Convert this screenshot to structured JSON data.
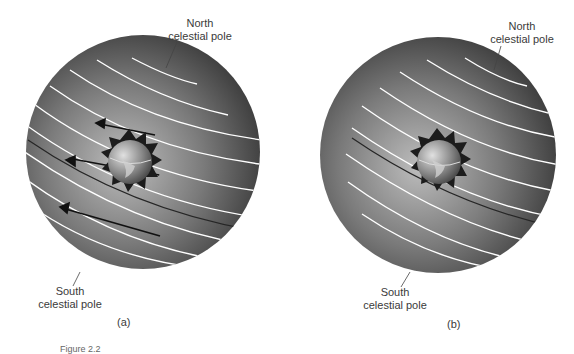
{
  "figure": {
    "caption_partial": "Figure 2.2",
    "panels": [
      {
        "id": "a",
        "panel_label": "(a)",
        "north_label_line1": "North",
        "north_label_line2": "celestial pole",
        "south_label_line1": "South",
        "south_label_line2": "celestial pole",
        "shows_motion_arrows": true
      },
      {
        "id": "b",
        "panel_label": "(b)",
        "north_label_line1": "North",
        "north_label_line2": "celestial pole",
        "south_label_line1": "South",
        "south_label_line2": "celestial pole",
        "shows_motion_arrows": false
      }
    ]
  },
  "colors": {
    "sphere_light": "#b8b8b8",
    "sphere_dark": "#3c3c3c",
    "circle_lines": "#ffffff",
    "ecliptic_line": "#2a2a2a",
    "earth": "#8a8a8a",
    "sun_star": "#1e1e1e"
  }
}
